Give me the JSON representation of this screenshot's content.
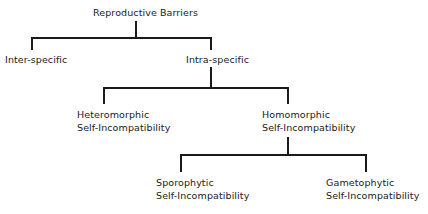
{
  "diagram": {
    "type": "tree",
    "root": {
      "label": "Reproductive Barriers",
      "children": [
        {
          "label": "Inter-specific"
        },
        {
          "label": "Intra-specific",
          "children": [
            {
              "label_line1": "Heteromorphic",
              "label_line2": "Self-Incompatibility"
            },
            {
              "label_line1": "Homomorphic",
              "label_line2": "Self-Incompatibility",
              "children": [
                {
                  "label_line1": "Sporophytic",
                  "label_line2": "Self-Incompatibility"
                },
                {
                  "label_line1": "Gametophytic",
                  "label_line2": "Self-Incompatibility"
                }
              ]
            }
          ]
        }
      ]
    },
    "line_color": "#1a1a1a"
  }
}
